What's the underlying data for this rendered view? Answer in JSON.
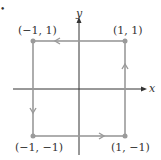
{
  "diagram": {
    "axes": {
      "x_label": "x",
      "y_label": "y"
    },
    "marker": "•",
    "vertices": [
      {
        "label": "(1, 1)",
        "x": 1,
        "y": 1
      },
      {
        "label": "(−1, 1)",
        "x": -1,
        "y": 1
      },
      {
        "label": "(−1, −1)",
        "x": -1,
        "y": -1
      },
      {
        "label": "(1, −1)",
        "x": 1,
        "y": -1
      }
    ],
    "path_direction": "counterclockwise",
    "colors": {
      "path": "#9a9a9a",
      "axes": "#333333"
    }
  }
}
